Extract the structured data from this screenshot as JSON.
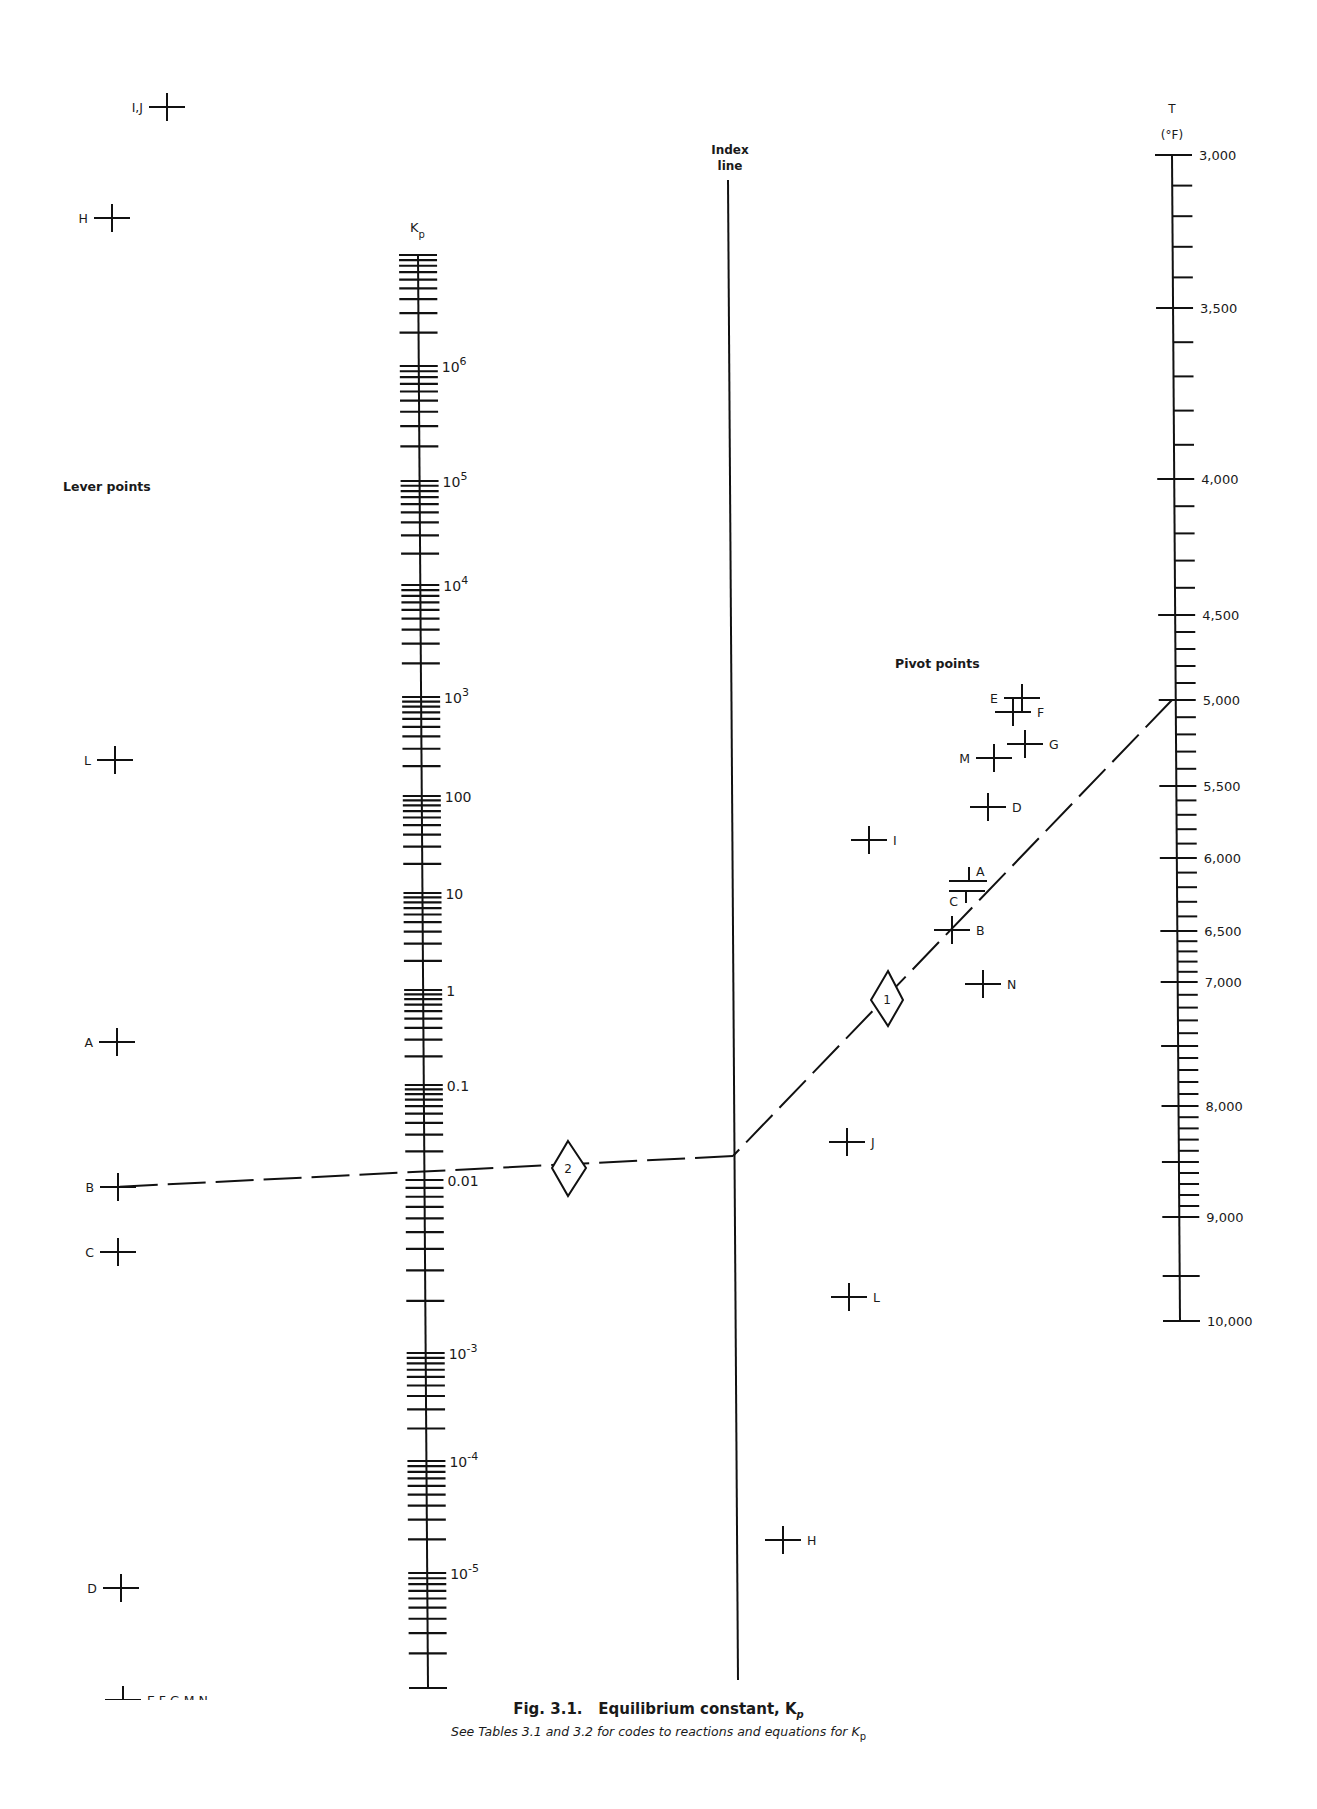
{
  "figure": {
    "title_prefix": "Fig.  3.1.",
    "title_text": "Equilibrium constant, K",
    "title_subscript": "p",
    "subtitle_text": "See Tables 3.1 and 3.2 for codes to reactions and equations for K",
    "subtitle_subscript": "p"
  },
  "axes": {
    "kp": {
      "label": "K",
      "label_subscript": "p",
      "scale": "log",
      "range": [
        1e-06,
        10000000.0
      ],
      "tick_labels": [
        {
          "value": 1000000.0,
          "base": "10",
          "exp": "6"
        },
        {
          "value": 100000.0,
          "base": "10",
          "exp": "5"
        },
        {
          "value": 10000.0,
          "base": "10",
          "exp": "4"
        },
        {
          "value": 1000.0,
          "base": "10",
          "exp": "3"
        },
        {
          "value": 100,
          "base": "100",
          "exp": ""
        },
        {
          "value": 10,
          "base": "10",
          "exp": ""
        },
        {
          "value": 1,
          "base": "1",
          "exp": ""
        },
        {
          "value": 0.1,
          "base": "0.1",
          "exp": ""
        },
        {
          "value": 0.01,
          "base": "0.01",
          "exp": ""
        },
        {
          "value": 0.001,
          "base": "10",
          "exp": "-3"
        },
        {
          "value": 0.0001,
          "base": "10",
          "exp": "-4"
        },
        {
          "value": 1e-05,
          "base": "10",
          "exp": "-5"
        }
      ]
    },
    "index_line": {
      "label_line1": "Index",
      "label_line2": "line"
    },
    "temperature": {
      "label": "T",
      "unit_label": "(°F)",
      "range": [
        3000,
        10000
      ],
      "major_ticks": [
        3000,
        3500,
        4000,
        4500,
        5000,
        5500,
        6000,
        6500,
        7000,
        7500,
        8000,
        8500,
        9000,
        9500,
        10000
      ],
      "tick_labels": [
        {
          "value": 3000,
          "text": "3,000"
        },
        {
          "value": 3500,
          "text": "3,500"
        },
        {
          "value": 4000,
          "text": "4,000"
        },
        {
          "value": 4500,
          "text": "4,500"
        },
        {
          "value": 5000,
          "text": "5,000"
        },
        {
          "value": 5500,
          "text": "5,500"
        },
        {
          "value": 6000,
          "text": "6,000"
        },
        {
          "value": 6500,
          "text": "6,500"
        },
        {
          "value": 7000,
          "text": "7,000"
        },
        {
          "value": 8000,
          "text": "8,000"
        },
        {
          "value": 9000,
          "text": "9,000"
        },
        {
          "value": 10000,
          "text": "10,000"
        }
      ]
    }
  },
  "lever_points": {
    "heading": "Lever points",
    "points": [
      {
        "label": "I,J"
      },
      {
        "label": "H"
      },
      {
        "label": "L"
      },
      {
        "label": "A"
      },
      {
        "label": "B"
      },
      {
        "label": "C"
      },
      {
        "label": "D"
      },
      {
        "label": "E,F,G,M,N"
      }
    ]
  },
  "pivot_points": {
    "heading": "Pivot points",
    "points": [
      {
        "label": "E"
      },
      {
        "label": "F"
      },
      {
        "label": "G"
      },
      {
        "label": "M"
      },
      {
        "label": "D"
      },
      {
        "label": "I"
      },
      {
        "label": "A"
      },
      {
        "label": "C"
      },
      {
        "label": "B"
      },
      {
        "label": "N"
      },
      {
        "label": "J"
      },
      {
        "label": "L"
      },
      {
        "label": "H"
      }
    ]
  },
  "example": {
    "step1_marker": "1",
    "step2_marker": "2",
    "temperature_value": 5000,
    "pivot_used": "B",
    "lever_used": "B",
    "kp_result_approx": 0.05
  }
}
